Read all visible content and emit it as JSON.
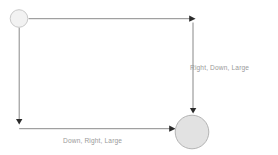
{
  "diagram": {
    "type": "state-transition-flow",
    "background_color": "#ffffff",
    "nodes": [
      {
        "id": "start-node",
        "name": "small-circle-node",
        "shape": "circle",
        "cx": 19,
        "cy": 18.5,
        "r": 9,
        "fill": "#f2f2f2",
        "stroke": "#c9c9c9",
        "label": ""
      },
      {
        "id": "end-node",
        "name": "large-circle-node",
        "shape": "circle",
        "cx": 192,
        "cy": 132,
        "r": 17,
        "fill": "#e2e2e2",
        "stroke": "#b4b4b4",
        "label": ""
      }
    ],
    "edges": [
      {
        "id": "edge-top-right",
        "name": "edge-right-down-large",
        "label": "Right, Down, Large",
        "label_x": 190,
        "label_y": 70,
        "color": "#6b6b6b",
        "path": "M 28.5 18.5 L 190 18.5 M 193 24 L 193 109",
        "arrowheads": [
          {
            "x": 193,
            "y": 19,
            "direction": "right"
          },
          {
            "x": 193,
            "y": 111,
            "direction": "down"
          }
        ]
      },
      {
        "id": "edge-left-bottom",
        "name": "edge-down-right-large",
        "label": "Down, Right, Large",
        "label_x": 63,
        "label_y": 143,
        "color": "#6b6b6b",
        "path": "M 19 27.5 L 19 120 M 24 128.5 L 170 128.5",
        "arrowheads": [
          {
            "x": 19,
            "y": 122,
            "direction": "down"
          },
          {
            "x": 172,
            "y": 128.5,
            "direction": "right"
          }
        ]
      }
    ]
  },
  "labels": {
    "right_down_large": "Right, Down, Large",
    "down_right_large": "Down, Right, Large"
  }
}
